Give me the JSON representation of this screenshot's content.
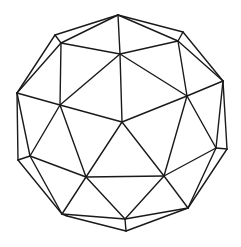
{
  "figure": {
    "type": "wireframe-polyhedron",
    "stroke_color": "#1a1a1a",
    "background_color": "#ffffff"
  },
  "vertices": {
    "T0": [
      118,
      15
    ],
    "A1": [
      55,
      35
    ],
    "A2": [
      61,
      43
    ],
    "B1": [
      183,
      32
    ],
    "B2": [
      178,
      41
    ],
    "C": [
      120,
      54
    ],
    "L": [
      17,
      93
    ],
    "D": [
      60,
      105
    ],
    "R": [
      223,
      81
    ],
    "E": [
      187,
      96
    ],
    "F": [
      122,
      122
    ],
    "G1": [
      18,
      160
    ],
    "G2": [
      30,
      156
    ],
    "H": [
      86,
      177
    ],
    "I": [
      164,
      176
    ],
    "J1": [
      216,
      148
    ],
    "J2": [
      227,
      149
    ],
    "K1": [
      62,
      214
    ],
    "K2": [
      67,
      216
    ],
    "M": [
      188,
      208
    ],
    "N1": [
      125,
      219
    ],
    "N2": [
      126,
      231
    ]
  },
  "edges": [
    [
      "T0",
      "A1"
    ],
    [
      "T0",
      "A2"
    ],
    [
      "T0",
      "C"
    ],
    [
      "T0",
      "B1"
    ],
    [
      "T0",
      "B2"
    ],
    [
      "A1",
      "A2"
    ],
    [
      "A1",
      "L"
    ],
    [
      "A2",
      "L"
    ],
    [
      "A2",
      "C"
    ],
    [
      "A2",
      "D"
    ],
    [
      "B1",
      "B2"
    ],
    [
      "B1",
      "R"
    ],
    [
      "B2",
      "R"
    ],
    [
      "B2",
      "C"
    ],
    [
      "B2",
      "E"
    ],
    [
      "C",
      "D"
    ],
    [
      "C",
      "E"
    ],
    [
      "C",
      "F"
    ],
    [
      "L",
      "D"
    ],
    [
      "L",
      "G1"
    ],
    [
      "L",
      "G2"
    ],
    [
      "D",
      "F"
    ],
    [
      "D",
      "G2"
    ],
    [
      "D",
      "H"
    ],
    [
      "R",
      "E"
    ],
    [
      "R",
      "J1"
    ],
    [
      "R",
      "J2"
    ],
    [
      "E",
      "F"
    ],
    [
      "E",
      "I"
    ],
    [
      "E",
      "J1"
    ],
    [
      "F",
      "H"
    ],
    [
      "F",
      "I"
    ],
    [
      "G1",
      "G2"
    ],
    [
      "G1",
      "K1"
    ],
    [
      "G2",
      "K1"
    ],
    [
      "G2",
      "H"
    ],
    [
      "H",
      "K1"
    ],
    [
      "H",
      "I"
    ],
    [
      "H",
      "N1"
    ],
    [
      "I",
      "N1"
    ],
    [
      "I",
      "M"
    ],
    [
      "I",
      "J1"
    ],
    [
      "J1",
      "J2"
    ],
    [
      "J1",
      "M"
    ],
    [
      "J2",
      "M"
    ],
    [
      "K1",
      "K2"
    ],
    [
      "K1",
      "N1"
    ],
    [
      "K2",
      "N2"
    ],
    [
      "M",
      "N1"
    ],
    [
      "M",
      "N2"
    ],
    [
      "N1",
      "N2"
    ]
  ]
}
